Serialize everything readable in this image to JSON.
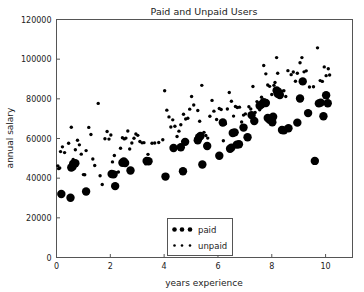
{
  "chart_data": {
    "type": "scatter",
    "title": "Paid and Unpaid Users",
    "xlabel": "years experience",
    "ylabel": "annual salary",
    "xlim": [
      0,
      11
    ],
    "ylim": [
      0,
      120000
    ],
    "xticks": [
      0,
      2,
      4,
      6,
      8,
      10
    ],
    "xticklabels": [
      "0",
      "2",
      "4",
      "6",
      "8",
      "10"
    ],
    "yticks": [
      0,
      20000,
      40000,
      60000,
      80000,
      100000,
      120000
    ],
    "yticklabels": [
      "0",
      "20000",
      "40000",
      "60000",
      "80000",
      "100000",
      "120000"
    ],
    "grid": false,
    "legend_position": "lower center",
    "marker_color": "#000000",
    "axis_color": "#444444",
    "background": "#ffffff",
    "series": [
      {
        "name": "paid",
        "marker": "filled-circle",
        "marker_size": 4.2,
        "color": "#000000",
        "points": [
          [
            0.18,
            32000
          ],
          [
            0.52,
            30100
          ],
          [
            0.55,
            45400
          ],
          [
            0.6,
            45900
          ],
          [
            0.62,
            47300
          ],
          [
            0.7,
            47500
          ],
          [
            1.1,
            33300
          ],
          [
            2.05,
            42100
          ],
          [
            2.12,
            41900
          ],
          [
            2.18,
            36000
          ],
          [
            2.45,
            47800
          ],
          [
            2.5,
            48400
          ],
          [
            2.55,
            47600
          ],
          [
            2.75,
            43900
          ],
          [
            3.35,
            48700
          ],
          [
            3.42,
            48500
          ],
          [
            4.05,
            40800
          ],
          [
            4.35,
            55200
          ],
          [
            4.62,
            55600
          ],
          [
            4.7,
            43500
          ],
          [
            4.78,
            58300
          ],
          [
            5.25,
            59100
          ],
          [
            5.3,
            60600
          ],
          [
            5.35,
            61300
          ],
          [
            5.42,
            46900
          ],
          [
            5.6,
            56200
          ],
          [
            6.05,
            51300
          ],
          [
            6.18,
            68100
          ],
          [
            6.45,
            54800
          ],
          [
            6.5,
            55400
          ],
          [
            6.55,
            62800
          ],
          [
            6.62,
            63100
          ],
          [
            6.7,
            56900
          ],
          [
            6.78,
            57100
          ],
          [
            6.95,
            65500
          ],
          [
            7.1,
            60600
          ],
          [
            7.25,
            71800
          ],
          [
            7.35,
            68800
          ],
          [
            7.55,
            76500
          ],
          [
            7.62,
            77200
          ],
          [
            7.7,
            78300
          ],
          [
            7.78,
            77900
          ],
          [
            7.85,
            70300
          ],
          [
            7.92,
            69500
          ],
          [
            8.02,
            68200
          ],
          [
            8.05,
            71000
          ],
          [
            8.18,
            84200
          ],
          [
            8.22,
            82600
          ],
          [
            8.3,
            81900
          ],
          [
            8.38,
            64300
          ],
          [
            8.45,
            64100
          ],
          [
            8.62,
            65200
          ],
          [
            8.95,
            68000
          ],
          [
            9.05,
            80200
          ],
          [
            9.15,
            88800
          ],
          [
            9.35,
            72800
          ],
          [
            9.6,
            48700
          ],
          [
            9.75,
            77700
          ],
          [
            9.82,
            78100
          ],
          [
            9.92,
            71200
          ],
          [
            10.02,
            81800
          ],
          [
            10.08,
            77800
          ]
        ]
      },
      {
        "name": "unpaid",
        "marker": "small-dot",
        "marker_size": 1.7,
        "color": "#000000",
        "points": [
          [
            0.05,
            46200
          ],
          [
            0.08,
            44800
          ],
          [
            0.12,
            45100
          ],
          [
            0.15,
            53400
          ],
          [
            0.22,
            55800
          ],
          [
            0.3,
            52900
          ],
          [
            0.45,
            57600
          ],
          [
            0.55,
            65700
          ],
          [
            0.62,
            49400
          ],
          [
            0.7,
            54300
          ],
          [
            0.78,
            59100
          ],
          [
            0.85,
            56800
          ],
          [
            0.92,
            52100
          ],
          [
            1.0,
            41800
          ],
          [
            1.05,
            41700
          ],
          [
            1.1,
            53900
          ],
          [
            1.2,
            65600
          ],
          [
            1.28,
            62000
          ],
          [
            1.35,
            49700
          ],
          [
            1.42,
            46400
          ],
          [
            1.55,
            77700
          ],
          [
            1.62,
            41200
          ],
          [
            1.7,
            36800
          ],
          [
            1.8,
            59900
          ],
          [
            1.88,
            63500
          ],
          [
            1.95,
            59700
          ],
          [
            2.02,
            61800
          ],
          [
            2.08,
            48200
          ],
          [
            2.15,
            51400
          ],
          [
            2.22,
            42800
          ],
          [
            2.3,
            43100
          ],
          [
            2.38,
            55100
          ],
          [
            2.45,
            60400
          ],
          [
            2.52,
            59800
          ],
          [
            2.58,
            60200
          ],
          [
            2.65,
            63800
          ],
          [
            2.72,
            54700
          ],
          [
            2.8,
            57700
          ],
          [
            2.88,
            60100
          ],
          [
            2.95,
            62300
          ],
          [
            3.02,
            61600
          ],
          [
            3.1,
            58500
          ],
          [
            3.18,
            57800
          ],
          [
            3.25,
            57900
          ],
          [
            3.32,
            47200
          ],
          [
            3.4,
            52000
          ],
          [
            3.55,
            57600
          ],
          [
            3.65,
            57700
          ],
          [
            3.8,
            58000
          ],
          [
            3.95,
            59400
          ],
          [
            4.02,
            84100
          ],
          [
            4.1,
            74300
          ],
          [
            4.18,
            70900
          ],
          [
            4.25,
            65800
          ],
          [
            4.32,
            69400
          ],
          [
            4.4,
            66200
          ],
          [
            4.48,
            61000
          ],
          [
            4.55,
            63700
          ],
          [
            4.62,
            66900
          ],
          [
            4.72,
            72200
          ],
          [
            4.8,
            69800
          ],
          [
            4.88,
            70200
          ],
          [
            4.95,
            74800
          ],
          [
            5.02,
            81200
          ],
          [
            5.1,
            76900
          ],
          [
            5.18,
            59900
          ],
          [
            5.25,
            74100
          ],
          [
            5.32,
            68700
          ],
          [
            5.4,
            86800
          ],
          [
            5.48,
            63100
          ],
          [
            5.55,
            61500
          ],
          [
            5.62,
            60200
          ],
          [
            5.7,
            71200
          ],
          [
            5.78,
            79200
          ],
          [
            5.85,
            73800
          ],
          [
            5.95,
            69600
          ],
          [
            6.05,
            75100
          ],
          [
            6.12,
            74600
          ],
          [
            6.2,
            58900
          ],
          [
            6.28,
            67400
          ],
          [
            6.35,
            74900
          ],
          [
            6.42,
            83200
          ],
          [
            6.5,
            78800
          ],
          [
            6.58,
            71300
          ],
          [
            6.65,
            76100
          ],
          [
            6.72,
            75600
          ],
          [
            6.8,
            75800
          ],
          [
            6.88,
            68300
          ],
          [
            6.95,
            71800
          ],
          [
            7.02,
            72400
          ],
          [
            7.15,
            76000
          ],
          [
            7.22,
            74900
          ],
          [
            7.3,
            86200
          ],
          [
            7.38,
            73100
          ],
          [
            7.45,
            78600
          ],
          [
            7.55,
            74500
          ],
          [
            7.62,
            80800
          ],
          [
            7.7,
            96800
          ],
          [
            7.78,
            92600
          ],
          [
            7.85,
            87000
          ],
          [
            7.92,
            86300
          ],
          [
            8.0,
            82200
          ],
          [
            8.08,
            86800
          ],
          [
            8.12,
            88200
          ],
          [
            8.18,
            100800
          ],
          [
            8.22,
            92900
          ],
          [
            8.3,
            84600
          ],
          [
            8.38,
            83900
          ],
          [
            8.45,
            84100
          ],
          [
            8.52,
            81200
          ],
          [
            8.6,
            94200
          ],
          [
            8.72,
            92200
          ],
          [
            8.8,
            93500
          ],
          [
            8.88,
            88900
          ],
          [
            8.95,
            92900
          ],
          [
            9.05,
            98200
          ],
          [
            9.12,
            100800
          ],
          [
            9.2,
            93600
          ],
          [
            9.28,
            94100
          ],
          [
            9.4,
            86000
          ],
          [
            9.55,
            86100
          ],
          [
            9.7,
            105700
          ],
          [
            9.8,
            89200
          ],
          [
            9.88,
            88800
          ],
          [
            9.95,
            96100
          ],
          [
            10.02,
            91700
          ],
          [
            10.1,
            95200
          ],
          [
            10.15,
            92000
          ]
        ]
      }
    ]
  },
  "legend": {
    "entries": [
      {
        "label": "paid",
        "marker": "filled-circle"
      },
      {
        "label": "unpaid",
        "marker": "small-dot"
      }
    ]
  }
}
